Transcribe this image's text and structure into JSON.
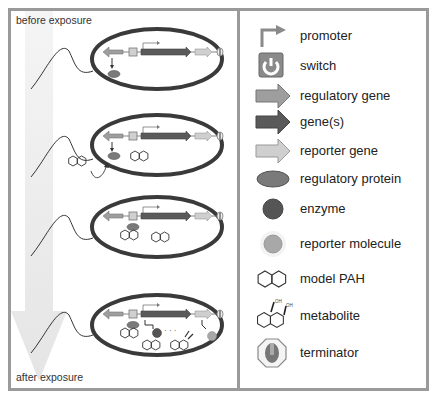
{
  "left_panel": {
    "top_label": "before exposure",
    "bottom_label": "after exposure",
    "stages": [
      {
        "id": 1,
        "description": "regulatory protein expressed, no PAH"
      },
      {
        "id": 2,
        "description": "PAH approaching cell"
      },
      {
        "id": 3,
        "description": "PAH bound to regulatory protein at switch"
      },
      {
        "id": 4,
        "description": "genes expressed, enzyme converts PAH to metabolite, reporter molecule produced"
      }
    ]
  },
  "legend": {
    "items": [
      {
        "icon": "promoter-icon",
        "label": "promoter"
      },
      {
        "icon": "switch-icon",
        "label": "switch"
      },
      {
        "icon": "regulatory-gene-icon",
        "label": "regulatory gene"
      },
      {
        "icon": "genes-icon",
        "label": "gene(s)"
      },
      {
        "icon": "reporter-gene-icon",
        "label": "reporter gene"
      },
      {
        "icon": "regulatory-protein-icon",
        "label": "regulatory protein"
      },
      {
        "icon": "enzyme-icon",
        "label": "enzyme"
      },
      {
        "icon": "reporter-molecule-icon",
        "label": "reporter molecule"
      },
      {
        "icon": "model-pah-icon",
        "label": "model PAH"
      },
      {
        "icon": "metabolite-icon",
        "label": "metabolite"
      },
      {
        "icon": "terminator-icon",
        "label": "terminator"
      }
    ],
    "metabolite_oh_label": "OH"
  },
  "colors": {
    "frame": "#9a9a9a",
    "cell_outline": "#3a3a3a",
    "regulatory_gene": "#9e9e9e",
    "genes": "#5a5a5a",
    "reporter_gene": "#cfcfcf",
    "switch": "#8a8a8a",
    "regulatory_protein": "#7a7a7a",
    "enzyme": "#555555",
    "reporter_molecule": "#a8a8a8",
    "gradient_arrow": "#e4e4e4"
  }
}
